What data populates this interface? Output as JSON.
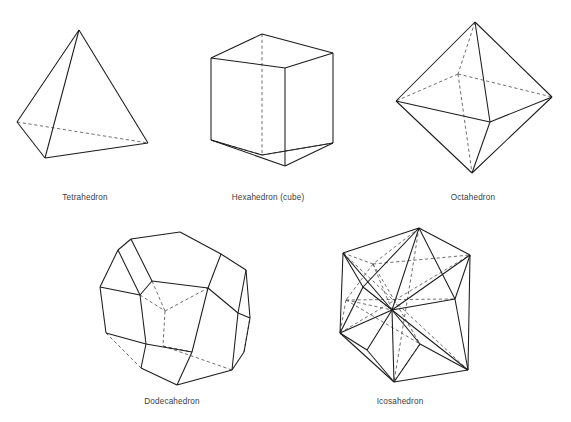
{
  "figure": {
    "background_color": "#ffffff",
    "edge_color": "#1b1b1b",
    "hidden_edge_color": "#555555",
    "label_color": "#3c3c3c",
    "width": 571,
    "height": 422
  },
  "solids": [
    {
      "id": "tetrahedron",
      "label": "Tetrahedron",
      "label_x": 85,
      "label_y": 200,
      "faces": 4,
      "vertices": 4,
      "edges": 6,
      "face_polygon": "triangle",
      "visible_edge_paths": [
        "M 79 30 L 17 122",
        "M 79 30 L 45 158",
        "M 79 30 L 148 143",
        "M 17 122 L 45 158",
        "M 45 158 L 148 143"
      ],
      "hidden_edge_paths": [
        "M 17 122 L 148 143"
      ]
    },
    {
      "id": "hexahedron",
      "label": "Hexahedron (cube)",
      "label_x": 268,
      "label_y": 200,
      "faces": 6,
      "vertices": 8,
      "edges": 12,
      "face_polygon": "square",
      "visible_edge_paths": [
        "M 211 58 L 285 68",
        "M 285 68 L 285 166",
        "M 285 166 L 211 140",
        "M 211 140 L 211 58",
        "M 211 58 L 262 34",
        "M 262 34 L 333 53",
        "M 333 53 L 285 68",
        "M 333 53 L 333 143",
        "M 333 143 L 285 166",
        "M 211 140 L 262 155",
        "M 262 155 L 333 143"
      ],
      "hidden_edge_paths": [
        "M 262 34 L 262 155",
        "M 211 140 L 262 155",
        "M 262 155 L 333 143"
      ]
    },
    {
      "id": "octahedron",
      "label": "Octahedron",
      "label_x": 473,
      "label_y": 200,
      "faces": 8,
      "vertices": 6,
      "edges": 12,
      "face_polygon": "triangle",
      "visible_edge_paths": [
        "M 475 22 L 396 101",
        "M 475 22 L 552 97",
        "M 475 22 L 490 122",
        "M 396 101 L 472 173",
        "M 552 97 L 472 173",
        "M 396 101 L 490 122",
        "M 552 97 L 490 122",
        "M 490 122 L 472 173"
      ],
      "hidden_edge_paths": [
        "M 475 22 L 458 74",
        "M 458 74 L 396 101",
        "M 458 74 L 552 97",
        "M 458 74 L 472 173"
      ]
    },
    {
      "id": "dodecahedron",
      "label": "Dodecahedron",
      "label_x": 172,
      "label_y": 404,
      "faces": 12,
      "vertices": 20,
      "edges": 30,
      "face_polygon": "pentagon",
      "visible_edge_paths": [
        "M 131 239 L 180 232",
        "M 180 232 L 221 254",
        "M 221 254 L 208 288",
        "M 208 288 L 152 281",
        "M 152 281 L 131 239",
        "M 131 239 L 118 250",
        "M 118 250 L 140 295",
        "M 140 295 L 152 281",
        "M 118 250 L 100 287",
        "M 100 287 L 140 295",
        "M 221 254 L 246 270",
        "M 246 270 L 238 313",
        "M 238 313 L 208 288",
        "M 246 270 L 250 318",
        "M 250 318 L 238 313",
        "M 140 295 L 146 344",
        "M 146 344 L 192 352",
        "M 192 352 L 208 288",
        "M 100 287 L 106 333",
        "M 106 333 L 146 344",
        "M 146 344 L 141 368",
        "M 141 368 L 177 385",
        "M 177 385 L 192 352",
        "M 177 385 L 232 370",
        "M 232 370 L 238 313",
        "M 232 370 L 244 352",
        "M 250 318 L 244 352"
      ],
      "hidden_edge_paths": [
        "M 152 281 L 165 311",
        "M 165 311 L 208 288",
        "M 165 311 L 163 346",
        "M 163 346 L 192 352",
        "M 140 295 L 165 311",
        "M 106 333 L 141 368",
        "M 163 346 L 232 370",
        "M 244 352 L 250 318"
      ]
    },
    {
      "id": "icosahedron",
      "label": "Icosahedron",
      "label_x": 400,
      "label_y": 404,
      "faces": 20,
      "vertices": 12,
      "edges": 30,
      "face_polygon": "triangle",
      "visible_edge_paths": [
        "M 419 228 L 343 253",
        "M 343 253 L 340 333",
        "M 340 333 L 394 382",
        "M 394 382 L 468 370",
        "M 468 370 L 470 255",
        "M 470 255 L 419 228",
        "M 419 228 L 392 310",
        "M 343 253 L 392 310",
        "M 340 333 L 392 310",
        "M 394 382 L 392 310",
        "M 468 370 L 392 310",
        "M 470 255 L 392 310",
        "M 419 228 L 363 287",
        "M 343 253 L 363 287",
        "M 340 333 L 363 287",
        "M 363 287 L 392 310",
        "M 419 228 L 455 299",
        "M 470 255 L 455 299",
        "M 468 370 L 455 299",
        "M 455 299 L 392 310",
        "M 394 382 L 420 344",
        "M 468 370 L 420 344",
        "M 420 344 L 392 310",
        "M 340 333 L 367 350",
        "M 367 350 L 394 382",
        "M 367 350 L 392 310"
      ],
      "hidden_edge_paths": [
        "M 419 228 L 373 264",
        "M 343 253 L 373 264",
        "M 373 264 L 392 310",
        "M 373 264 L 346 300",
        "M 346 300 L 340 333",
        "M 346 300 L 392 310",
        "M 373 264 L 470 255",
        "M 346 300 L 455 299",
        "M 419 228 L 394 382",
        "M 343 253 L 468 370",
        "M 340 333 L 470 255",
        "M 373 264 L 420 344",
        "M 346 300 L 420 344",
        "M 420 344 L 394 382"
      ]
    }
  ]
}
